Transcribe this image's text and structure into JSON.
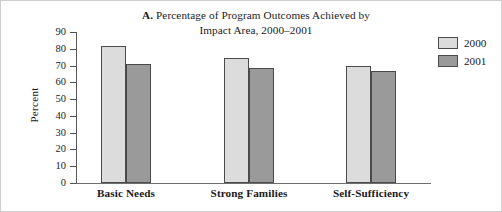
{
  "chart_data": {
    "type": "bar",
    "title": "A. Percentage of Program Outcomes Achieved by Impact Area, 2000–2001",
    "title_lead": "A.",
    "title_line1": "Percentage of Program Outcomes Achieved by",
    "title_line2": "Impact Area, 2000–2001",
    "xlabel": "",
    "ylabel": "Percent",
    "ylim": [
      0,
      90
    ],
    "ytick_step": 10,
    "ytick_labels": [
      "90",
      "80",
      "70",
      "60",
      "50",
      "40",
      "30",
      "20",
      "10",
      "0"
    ],
    "grid": false,
    "legend_position": "right",
    "categories": [
      "Basic Needs",
      "Strong Families",
      "Self-Sufficiency"
    ],
    "series": [
      {
        "name": "2000",
        "color": "#dcdcdc",
        "values": [
          81.5,
          74.5,
          69.5
        ]
      },
      {
        "name": "2001",
        "color": "#9a9a9a",
        "values": [
          71.0,
          68.5,
          66.5
        ]
      }
    ]
  },
  "legend": {
    "items": [
      {
        "label": "2000"
      },
      {
        "label": "2001"
      }
    ]
  }
}
